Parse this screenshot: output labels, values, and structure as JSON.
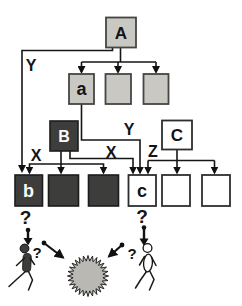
{
  "diagram": {
    "colors": {
      "light_box": "#c9c8c2",
      "dark_box": "#3d3d3b",
      "white_box": "#ffffff",
      "line": "#161616",
      "starburst_fill": "#b9b8b2",
      "figure_dark": "#3d3d3b"
    },
    "nodes": {
      "A": "A",
      "a": "a",
      "B": "B",
      "C": "C",
      "b": "b",
      "c": "c"
    },
    "edge_labels": {
      "y_left": "Y",
      "y_mid": "Y",
      "x_left": "X",
      "x_right": "X",
      "z": "Z"
    },
    "question_marks": {
      "below_b": "?",
      "below_c": "?",
      "left_figure": "?",
      "right_figure": "?"
    }
  }
}
